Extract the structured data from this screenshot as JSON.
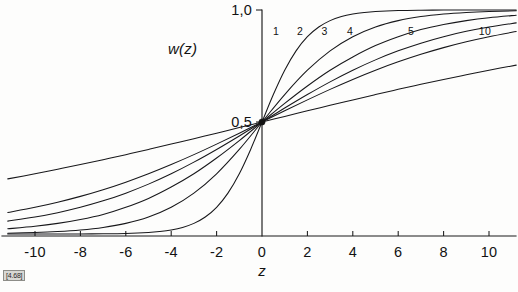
{
  "figure": {
    "reference_tag": "[4.68]",
    "background_color": "#fdfdfc",
    "ink_color": "#17171a"
  },
  "chart_data": {
    "type": "line",
    "title": "",
    "subtitle": "",
    "xlabel": "z",
    "ylabel": "w(z)",
    "xlim": [
      -11.2,
      11.2
    ],
    "ylim": [
      0.0,
      1.05
    ],
    "grid": false,
    "legend_position": "inline-curve-labels",
    "x_ticks": [
      -10,
      -8,
      -6,
      -4,
      -2,
      0,
      2,
      4,
      6,
      8,
      10
    ],
    "x_tick_labels": [
      "-10",
      "-8",
      "-6",
      "-4",
      "-2",
      "0",
      "2",
      "4",
      "6",
      "8",
      "10"
    ],
    "y_ticks": [
      0.5,
      1.0
    ],
    "y_tick_labels": [
      "0,5",
      "1,0"
    ],
    "annotations": [
      {
        "text": "w(z)",
        "x": -3.5,
        "y": 0.83
      },
      {
        "text": "z",
        "x": 0.0,
        "y": -0.16
      }
    ],
    "marked_points": [
      {
        "x": 0,
        "y": 0.5,
        "label": ""
      }
    ],
    "function_form": "w(z) = 1 / (1 + exp(-z/a))",
    "series": [
      {
        "name": "1",
        "param_a": 1,
        "label_x": 0.62,
        "label_y": 0.905,
        "x": [
          -11.2,
          -10,
          -9,
          -8,
          -7,
          -6,
          -5,
          -4.5,
          -4,
          -3.5,
          -3,
          -2.5,
          -2,
          -1.5,
          -1,
          -0.5,
          0,
          0.5,
          1,
          1.5,
          2,
          2.5,
          3,
          3.5,
          4,
          4.5,
          5,
          6,
          7,
          8,
          9,
          10,
          11.2
        ],
        "y": [
          0.0,
          0.0,
          0.0001,
          0.0003,
          0.0009,
          0.0025,
          0.0067,
          0.011,
          0.018,
          0.0293,
          0.0474,
          0.0759,
          0.1192,
          0.1824,
          0.2689,
          0.3775,
          0.5,
          0.6225,
          0.7311,
          0.8176,
          0.8808,
          0.9241,
          0.9526,
          0.9707,
          0.982,
          0.989,
          0.9933,
          0.9975,
          0.9991,
          0.9997,
          0.9999,
          1.0,
          1.0
        ]
      },
      {
        "name": "2",
        "param_a": 2,
        "label_x": 1.68,
        "label_y": 0.905,
        "x": [
          -11.2,
          -10,
          -9,
          -8,
          -7,
          -6,
          -5,
          -4,
          -3,
          -2,
          -1,
          0,
          1,
          2,
          3,
          4,
          5,
          6,
          7,
          8,
          9,
          10,
          11.2
        ],
        "y": [
          0.0037,
          0.0067,
          0.011,
          0.018,
          0.0293,
          0.0474,
          0.0759,
          0.1192,
          0.1824,
          0.2689,
          0.3775,
          0.5,
          0.6225,
          0.7311,
          0.8176,
          0.8808,
          0.9241,
          0.9526,
          0.9707,
          0.982,
          0.989,
          0.9933,
          0.9963
        ]
      },
      {
        "name": "3",
        "param_a": 3,
        "label_x": 2.76,
        "label_y": 0.905,
        "x": [
          -11.2,
          -10,
          -9,
          -8,
          -7,
          -6,
          -5,
          -4,
          -3,
          -2,
          -1,
          0,
          1,
          2,
          3,
          4,
          5,
          6,
          7,
          8,
          9,
          10,
          11.2
        ],
        "y": [
          0.0233,
          0.0344,
          0.0474,
          0.0646,
          0.0871,
          0.1192,
          0.1589,
          0.2097,
          0.2689,
          0.3392,
          0.417,
          0.5,
          0.583,
          0.6608,
          0.7311,
          0.7903,
          0.8411,
          0.8808,
          0.9129,
          0.9354,
          0.9526,
          0.9656,
          0.9767
        ]
      },
      {
        "name": "4",
        "param_a": 4,
        "label_x": 3.88,
        "label_y": 0.905,
        "x": [
          -11.2,
          -10,
          -9,
          -8,
          -7,
          -6,
          -5,
          -4,
          -3,
          -2,
          -1,
          0,
          1,
          2,
          3,
          4,
          5,
          6,
          7,
          8,
          9,
          10,
          11.2
        ],
        "y": [
          0.0574,
          0.0759,
          0.0953,
          0.1192,
          0.148,
          0.1824,
          0.2227,
          0.2689,
          0.3208,
          0.3775,
          0.4378,
          0.5,
          0.5622,
          0.6225,
          0.6792,
          0.7311,
          0.7773,
          0.8176,
          0.852,
          0.8808,
          0.9047,
          0.9241,
          0.9426
        ]
      },
      {
        "name": "5",
        "param_a": 5,
        "label_x": 6.56,
        "label_y": 0.905,
        "x": [
          -11.2,
          -10,
          -9,
          -8,
          -7,
          -6,
          -5,
          -4,
          -3,
          -2,
          -1,
          0,
          1,
          2,
          3,
          4,
          5,
          6,
          7,
          8,
          9,
          10,
          11.2
        ],
        "y": [
          0.0962,
          0.1192,
          0.1419,
          0.168,
          0.1978,
          0.2315,
          0.2689,
          0.31,
          0.3543,
          0.4013,
          0.4502,
          0.5,
          0.5498,
          0.5987,
          0.6457,
          0.69,
          0.7311,
          0.7685,
          0.8022,
          0.832,
          0.8581,
          0.8808,
          0.9038
        ]
      },
      {
        "name": "10",
        "param_a": 10,
        "label_x": 9.82,
        "label_y": 0.905,
        "x": [
          -11.2,
          -10,
          -9,
          -8,
          -7,
          -6,
          -5,
          -4,
          -3,
          -2,
          -1,
          0,
          1,
          2,
          3,
          4,
          5,
          6,
          7,
          8,
          9,
          10,
          11.2
        ],
        "y": [
          0.2461,
          0.2689,
          0.2891,
          0.31,
          0.3318,
          0.3543,
          0.3775,
          0.4013,
          0.4256,
          0.4502,
          0.475,
          0.5,
          0.525,
          0.5498,
          0.5744,
          0.5987,
          0.6225,
          0.6457,
          0.6682,
          0.69,
          0.7109,
          0.7311,
          0.7539
        ]
      }
    ]
  }
}
